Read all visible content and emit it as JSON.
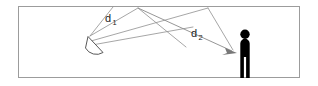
{
  "figure": {
    "name": "acoustic-reflection-diagram",
    "background_color": "#ffffff",
    "room": {
      "label": "room-boundary",
      "stroke_color": "#9a9a9a",
      "x": 18,
      "y": 6,
      "width": 282,
      "height": 72
    },
    "source": {
      "label": "directional-loudspeaker",
      "fill_color": "#ffffff",
      "stroke_color": "#555555",
      "apex_x": 88,
      "apex_y": 37
    },
    "listener": {
      "label": "listener-person",
      "fill_color": "#000000",
      "head_cx": 245,
      "head_cy": 34,
      "head_r": 4.6,
      "body_x": 240,
      "body_y": 40,
      "body_width": 10,
      "body_height": 38
    },
    "rays": {
      "stroke_color": "#8c8c8c",
      "direct_color": "#8c8c8c",
      "arrow_color": "#707070"
    }
  },
  "annotations": {
    "d1": {
      "base": "d",
      "subscript": "1",
      "x": 105,
      "y": 22,
      "meaning": "distance-to-ceiling-reflection-point"
    },
    "d2": {
      "base": "d",
      "subscript": "2",
      "x": 191,
      "y": 37,
      "meaning": "distance-from-reflection-point-to-listener"
    }
  },
  "geometry": {
    "ceiling_y": 7,
    "reflection_point_1": {
      "x": 138,
      "y": 8
    },
    "reflection_point_2": {
      "x": 208,
      "y": 8
    },
    "fan_upper_x": 122,
    "fan_upper_y": 13,
    "arrow_tip": {
      "x": 237,
      "y": 53
    }
  }
}
